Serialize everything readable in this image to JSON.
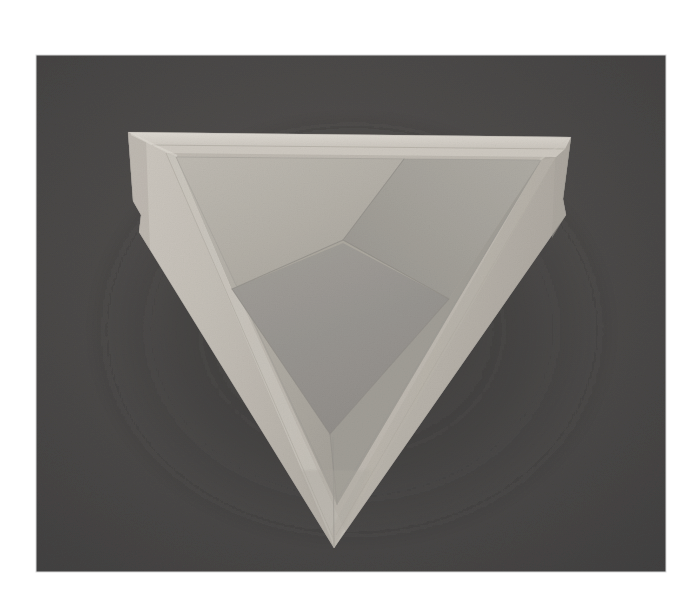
{
  "image": {
    "kind": "photograph",
    "subject": "origami-triangular-box",
    "subject_label": "Folded paper triangular box seen from above",
    "canvas": {
      "width": 700,
      "height": 612
    },
    "matte": {
      "name": "white-photo-border",
      "color": "#ffffff"
    },
    "photo_area": {
      "x": 36,
      "y": 55,
      "width": 630,
      "height": 517,
      "background_color": "#494949",
      "background_label": "dark grey studio backdrop"
    },
    "palette": {
      "background": "#494949",
      "background_light": "#505050",
      "background_dark": "#434343",
      "rim_highlight": "#d6d2cb",
      "outer_wall_light": "#c5c0b8",
      "outer_wall_mid": "#b8b3ab",
      "inner_wall_left": "#aeaaa2",
      "inner_wall_back": "#b4b0a8",
      "inner_wall_right": "#a3a09a",
      "floor": "#97948f",
      "crease_line": "#8e8b86",
      "shadow": "#3e3e3e",
      "matte": "#ffffff"
    },
    "geometry": {
      "outer_triangle": [
        {
          "name": "top-left-corner",
          "x": 128,
          "y": 132
        },
        {
          "name": "top-right-corner",
          "x": 571,
          "y": 137
        },
        {
          "name": "bottom-corner",
          "x": 334,
          "y": 548
        }
      ],
      "rim_inner_triangle": [
        {
          "name": "rim-top-left",
          "x": 157,
          "y": 148
        },
        {
          "name": "rim-top-right",
          "x": 552,
          "y": 152
        },
        {
          "name": "rim-bottom",
          "x": 335,
          "y": 520
        }
      ],
      "inner_opening_triangle": [
        {
          "name": "opening-top-left",
          "x": 176,
          "y": 157
        },
        {
          "name": "opening-top-right",
          "x": 541,
          "y": 160
        },
        {
          "name": "opening-bottom",
          "x": 337,
          "y": 500
        }
      ],
      "center_convergence": {
        "name": "inner-apex",
        "x": 343,
        "y": 240
      },
      "floor_triangle": [
        {
          "name": "floor-top",
          "x": 343,
          "y": 243
        },
        {
          "name": "floor-left",
          "x": 232,
          "y": 289
        },
        {
          "name": "floor-bottom",
          "x": 330,
          "y": 434
        },
        {
          "name": "floor-right",
          "x": 449,
          "y": 299
        }
      ],
      "side_notches": [
        {
          "name": "left-flap-notch",
          "x": 133,
          "y": 216
        },
        {
          "name": "right-flap-notch",
          "x": 566,
          "y": 228
        }
      ]
    },
    "faces": [
      {
        "name": "outer-left-wall",
        "shade": "#c2bdb5",
        "label": "left exterior wall"
      },
      {
        "name": "outer-right-wall",
        "shade": "#b6b1a9",
        "label": "right exterior wall"
      },
      {
        "name": "outer-bottom-wall",
        "shade": "#bdb8b0",
        "label": "bottom exterior wall"
      },
      {
        "name": "inner-left-wall",
        "shade": "#aeaaa2",
        "label": "left interior wall"
      },
      {
        "name": "inner-back-wall",
        "shade": "#b4b0a8",
        "label": "upper interior wall"
      },
      {
        "name": "inner-right-wall",
        "shade": "#a3a09a",
        "label": "right interior wall"
      },
      {
        "name": "box-floor",
        "shade": "#97948f",
        "label": "interior floor panel"
      }
    ],
    "creases": [
      {
        "name": "crease-center-to-top-rim",
        "from": [
          343,
          240
        ],
        "to": [
          404,
          158
        ]
      },
      {
        "name": "crease-center-to-left",
        "from": [
          343,
          240
        ],
        "to": [
          232,
          289
        ]
      },
      {
        "name": "crease-center-to-right",
        "from": [
          343,
          240
        ],
        "to": [
          449,
          299
        ]
      },
      {
        "name": "crease-bottom-seam",
        "from": [
          333,
          437
        ],
        "to": [
          334,
          546
        ]
      }
    ]
  },
  "overlay": {
    "title": "",
    "caption": ""
  }
}
